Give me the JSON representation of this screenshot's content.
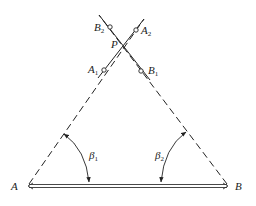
{
  "diagram": {
    "type": "surveying intersection geometry",
    "points": {
      "A": {
        "label": "A",
        "x": 27,
        "y": 186
      },
      "B": {
        "label": "B",
        "x": 229,
        "y": 186
      },
      "P": {
        "label": "P",
        "x": 124,
        "y": 44
      },
      "A1": {
        "label": "A",
        "sub": "1",
        "x": 104,
        "y": 70
      },
      "A2": {
        "label": "A",
        "sub": "2",
        "x": 136,
        "y": 31
      },
      "B1": {
        "label": "B",
        "sub": "1",
        "x": 143,
        "y": 71
      },
      "B2": {
        "label": "B",
        "sub": "2",
        "x": 112,
        "y": 28
      }
    },
    "angles": {
      "beta1": {
        "label": "β",
        "sub": "1"
      },
      "beta2": {
        "label": "β",
        "sub": "2"
      }
    },
    "baseline": "A–B (double line)",
    "sight_lines": "dashed lines from A and B intersecting at P"
  }
}
